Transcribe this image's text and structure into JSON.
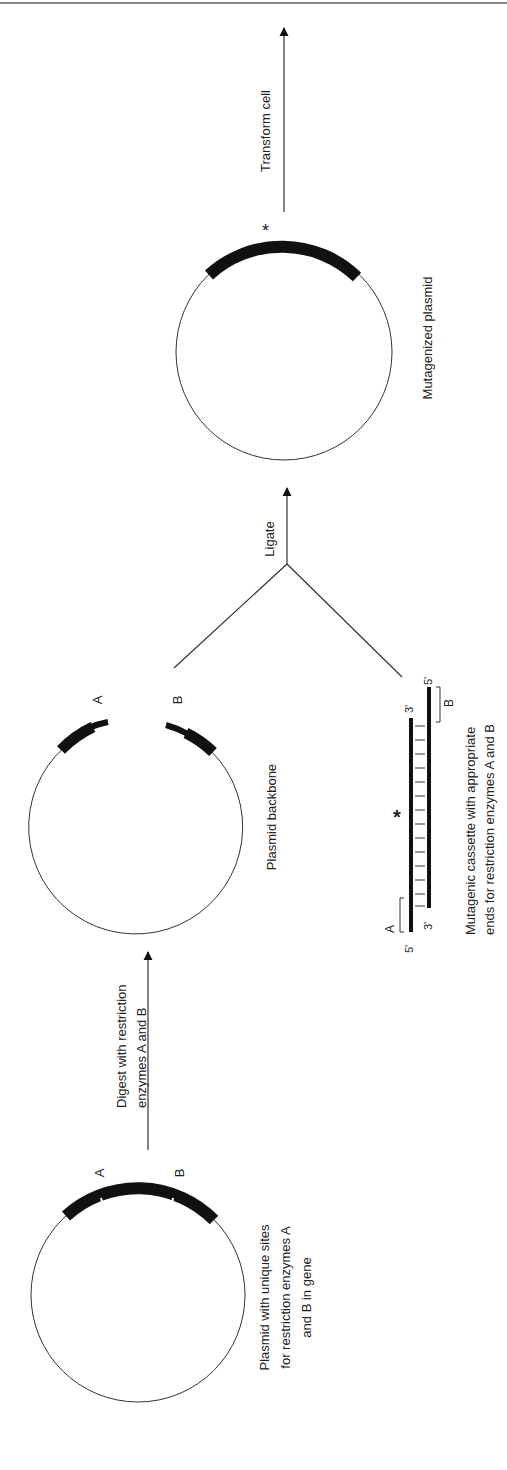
{
  "figure": {
    "steps": {
      "original_plasmid": {
        "site_a": "A",
        "site_b": "B",
        "caption_lines": [
          "Plasmid with unique sites",
          "for restriction enzymes A",
          "and B in gene"
        ]
      },
      "digest": {
        "arrow_label_lines": [
          "Digest with restriction",
          "enzymes A and B"
        ]
      },
      "backbone": {
        "site_a": "A",
        "site_b": "B",
        "caption": "Plasmid backbone"
      },
      "cassette": {
        "site_a": "A",
        "site_b": "B",
        "top_strand_left_end": "5'",
        "top_strand_right_end": "3'",
        "bottom_strand_left_end": "3'",
        "bottom_strand_right_end": "5'",
        "mutation_marker": "*",
        "caption_lines": [
          "Mutagenic cassette with appropriate",
          "ends for restriction enzymes A and B"
        ]
      },
      "ligate": {
        "arrow_label": "Ligate"
      },
      "mutagenized": {
        "mutation_marker": "*",
        "caption": "Mutagenized plasmid"
      },
      "transform": {
        "arrow_label": "Transform cell"
      }
    },
    "colors": {
      "ink": "#111111",
      "line": "#333333",
      "rule": "#8a8a8a"
    }
  }
}
